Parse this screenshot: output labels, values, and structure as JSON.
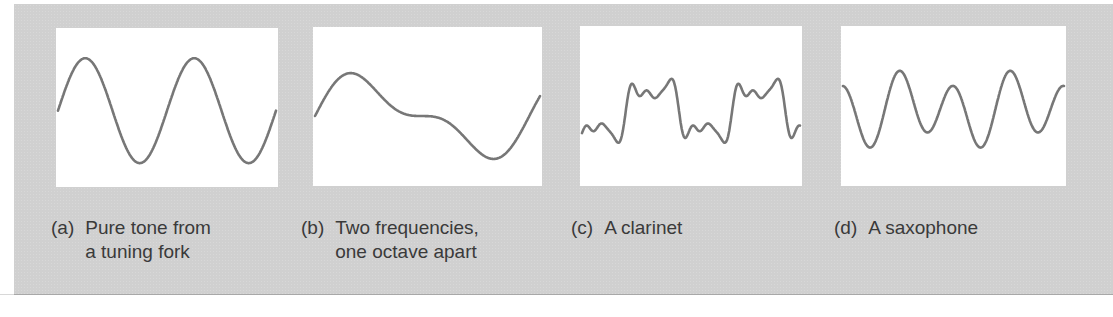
{
  "figure": {
    "background_color": "#d0d0d0",
    "panel_color": "#ffffff",
    "wave_color": "#777777",
    "text_color": "#3a3a3a"
  },
  "panels": [
    {
      "tag": "(a)",
      "lines": [
        "Pure tone from",
        "a tuning fork"
      ],
      "box": {
        "x": 56,
        "y": 28,
        "w": 222,
        "h": 159
      },
      "caption_pos": {
        "x": 51,
        "y": 216
      }
    },
    {
      "tag": "(b)",
      "lines": [
        "Two frequencies,",
        "one octave apart"
      ],
      "box": {
        "x": 313,
        "y": 27,
        "w": 229,
        "h": 159
      },
      "caption_pos": {
        "x": 301,
        "y": 216
      }
    },
    {
      "tag": "(c)",
      "lines": [
        "A clarinet"
      ],
      "box": {
        "x": 580,
        "y": 26,
        "w": 222,
        "h": 160
      },
      "caption_pos": {
        "x": 571,
        "y": 216
      }
    },
    {
      "tag": "(d)",
      "lines": [
        "A saxophone"
      ],
      "box": {
        "x": 841,
        "y": 26,
        "w": 225,
        "h": 160
      },
      "caption_pos": {
        "x": 834,
        "y": 216
      }
    }
  ],
  "chart_data": [
    {
      "type": "line",
      "title": "(a) Pure tone from a tuning fork",
      "xlabel": "",
      "ylabel": "",
      "grid": false,
      "description": "Single sinusoid, two full cycles",
      "cycles": 2,
      "phase": 0.0,
      "harmonics": [
        {
          "n": 1,
          "amp": 1.0,
          "phase": 0.0
        }
      ],
      "y_center": 0.52,
      "y_scale": 0.33
    },
    {
      "type": "line",
      "title": "(b) Two frequencies, one octave apart",
      "xlabel": "",
      "ylabel": "",
      "grid": false,
      "description": "Fundamental plus second harmonic (octave), ~1 cycle of fundamental",
      "cycles": 1.05,
      "phase": 0.0,
      "harmonics": [
        {
          "n": 1,
          "amp": 1.0,
          "phase": 0.0
        },
        {
          "n": 2,
          "amp": 0.5,
          "phase": 0.0
        }
      ],
      "y_center": 0.56,
      "y_scale": 0.27
    },
    {
      "type": "line",
      "title": "(c) A clarinet",
      "xlabel": "",
      "ylabel": "",
      "grid": false,
      "description": "Complex waveform rich in odd harmonics, ~2 cycles",
      "cycles": 2.05,
      "phase": 3.6,
      "harmonics": [
        {
          "n": 1,
          "amp": 1.0,
          "phase": 0.0
        },
        {
          "n": 3,
          "amp": 0.55,
          "phase": 0.3
        },
        {
          "n": 5,
          "amp": 0.3,
          "phase": 0.9
        },
        {
          "n": 7,
          "amp": 0.15,
          "phase": 0.4
        }
      ],
      "y_center": 0.53,
      "y_scale": 0.2
    },
    {
      "type": "line",
      "title": "(d) A saxophone",
      "xlabel": "",
      "ylabel": "",
      "grid": false,
      "description": "Alternating tall and short peaks, ~2 cycles of fundamental with strong second harmonic",
      "cycles": 2.0,
      "phase": 3.9,
      "harmonics": [
        {
          "n": 1,
          "amp": 0.35,
          "phase": 0.0
        },
        {
          "n": 2,
          "amp": 1.0,
          "phase": 0.0
        }
      ],
      "y_center": 0.52,
      "y_scale": 0.24
    }
  ]
}
